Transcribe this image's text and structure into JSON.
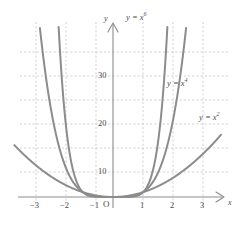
{
  "chart_data": {
    "type": "line",
    "title": "",
    "xlabel": "x",
    "ylabel": "y",
    "xlim": [
      -3.6,
      3.6
    ],
    "ylim": [
      -3,
      38
    ],
    "grid": true,
    "grid_style": "dashed",
    "legend": "inline-curve-labels",
    "origin_label": "O",
    "xticks": [
      -3,
      -2,
      -1,
      1,
      2,
      3
    ],
    "xtick_labels": [
      "−3",
      "−2",
      "−1",
      "1",
      "2",
      "3"
    ],
    "yticks": [
      10,
      20,
      30
    ],
    "ytick_labels": [
      "10",
      "20",
      "30"
    ],
    "series": [
      {
        "name": "y = x²",
        "label_html": "y = x<sup>2</sup>",
        "exponent": 2,
        "color": "#8c8c8c",
        "x": [
          -3.3,
          -3,
          -2.5,
          -2,
          -1.5,
          -1,
          -0.5,
          0,
          0.5,
          1,
          1.5,
          2,
          2.5,
          3,
          3.3
        ],
        "y": [
          10.89,
          9,
          6.25,
          4,
          2.25,
          1,
          0.25,
          0,
          0.25,
          1,
          2.25,
          4,
          6.25,
          9,
          10.89
        ]
      },
      {
        "name": "y = x⁴",
        "label_html": "y = x<sup>4</sup>",
        "exponent": 4,
        "color": "#8c8c8c",
        "x": [
          -2.4,
          -2.2,
          -2,
          -1.8,
          -1.5,
          -1.2,
          -1,
          -0.7,
          -0.4,
          0,
          0.4,
          0.7,
          1,
          1.2,
          1.5,
          1.8,
          2,
          2.2,
          2.4
        ],
        "y": [
          33.18,
          23.43,
          16,
          10.49,
          5.06,
          2.07,
          1,
          0.24,
          0.03,
          0,
          0.03,
          0.24,
          1,
          2.07,
          5.06,
          10.49,
          16,
          23.43,
          33.18
        ]
      },
      {
        "name": "y = x⁶",
        "label_html": "y = x<sup>6</sup>",
        "exponent": 6,
        "color": "#8c8c8c",
        "x": [
          -1.82,
          -1.7,
          -1.6,
          -1.5,
          -1.3,
          -1.1,
          -1,
          -0.8,
          -0.5,
          0,
          0.5,
          0.8,
          1,
          1.1,
          1.3,
          1.5,
          1.6,
          1.7,
          1.82
        ],
        "y": [
          36.4,
          24.1,
          16.8,
          11.4,
          4.83,
          1.77,
          1,
          0.26,
          0.016,
          0,
          0.016,
          0.26,
          1,
          1.77,
          4.83,
          11.4,
          16.8,
          24.1,
          36.4
        ]
      }
    ],
    "curve_labels": [
      {
        "text": "y = x⁶",
        "html": "y = x<sup>6</sup>",
        "left": 126,
        "top": 12
      },
      {
        "text": "y = x⁴",
        "html": "y = x<sup>4</sup>",
        "left": 167,
        "top": 78
      },
      {
        "text": "y = x²",
        "html": "y = x<sup>2</sup>",
        "left": 200,
        "top": 112
      }
    ],
    "colors": {
      "curve": "#8c8c8c",
      "axis": "#8c8c8c",
      "grid": "#b9b9c6",
      "text": "#4c4c4c",
      "background": "#ffffff"
    }
  }
}
